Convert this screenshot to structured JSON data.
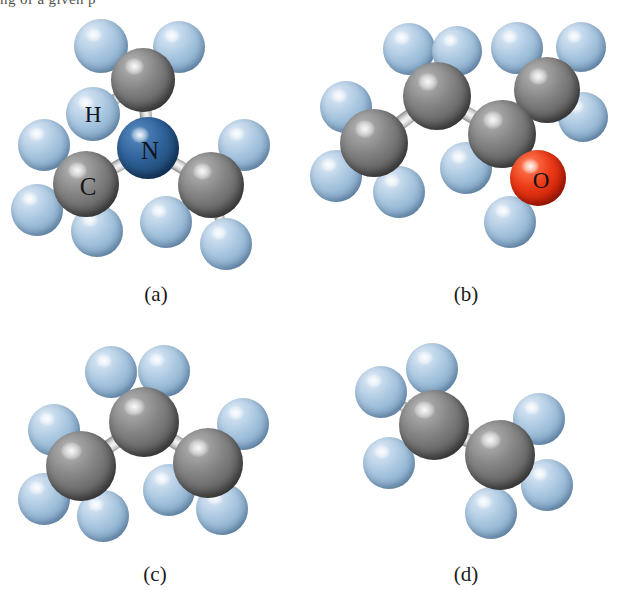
{
  "figure": {
    "clipped_header_text": "ng of a given p",
    "background_color": "#ffffff",
    "width": 623,
    "height": 590
  },
  "palette": {
    "carbon": "#787878",
    "hydrogen": "#a8c4dc",
    "nitrogen": "#2d5a8e",
    "oxygen": "#e03018",
    "bond": "#d8d8d8",
    "label_text": "#11161c",
    "caption_text": "#1a1a1a"
  },
  "panels": [
    {
      "id": "a",
      "caption": "(a)",
      "molecule_name": "trimethylamine",
      "formula": "N(CH3)3",
      "atom_counts": {
        "C": 3,
        "N": 1,
        "H": 9
      },
      "labels": [
        {
          "text": "H",
          "element": "H"
        },
        {
          "text": "N",
          "element": "N"
        },
        {
          "text": "C",
          "element": "C"
        }
      ]
    },
    {
      "id": "b",
      "caption": "(b)",
      "molecule_name": "butan-2-ol",
      "formula": "C4H9OH",
      "atom_counts": {
        "C": 4,
        "O": 1,
        "H": 10
      },
      "labels": [
        {
          "text": "O",
          "element": "O"
        }
      ]
    },
    {
      "id": "c",
      "caption": "(c)",
      "molecule_name": "propane",
      "formula": "C3H8",
      "atom_counts": {
        "C": 3,
        "H": 8
      },
      "labels": []
    },
    {
      "id": "d",
      "caption": "(d)",
      "molecule_name": "ethane",
      "formula": "C2H6",
      "atom_counts": {
        "C": 2,
        "H": 6
      },
      "labels": []
    }
  ],
  "captions": {
    "a": "(a)",
    "b": "(b)",
    "c": "(c)",
    "d": "(d)"
  },
  "atom_labels": {
    "a_H": "H",
    "a_N": "N",
    "a_C": "C",
    "b_O": "O"
  },
  "geometry": {
    "panel_a": {
      "box": [
        0,
        0,
        311,
        295
      ],
      "atoms": [
        {
          "n": "H",
          "t": "H",
          "x": 101,
          "y": 46,
          "r": 27
        },
        {
          "n": "H",
          "t": "H",
          "x": 179,
          "y": 47,
          "r": 26
        },
        {
          "n": "H",
          "t": "H",
          "x": 93,
          "y": 114,
          "r": 27
        },
        {
          "n": "C",
          "t": "C",
          "x": 143,
          "y": 80,
          "r": 32
        },
        {
          "n": "N",
          "t": "N",
          "x": 148,
          "y": 148,
          "r": 31
        },
        {
          "n": "C",
          "t": "C",
          "x": 86,
          "y": 184,
          "r": 33
        },
        {
          "n": "H",
          "t": "H",
          "x": 44,
          "y": 145,
          "r": 26
        },
        {
          "n": "H",
          "t": "H",
          "x": 37,
          "y": 210,
          "r": 26
        },
        {
          "n": "H",
          "t": "H",
          "x": 97,
          "y": 231,
          "r": 26
        },
        {
          "n": "C",
          "t": "C",
          "x": 211,
          "y": 185,
          "r": 33
        },
        {
          "n": "H",
          "t": "H",
          "x": 244,
          "y": 145,
          "r": 26
        },
        {
          "n": "H",
          "t": "H",
          "x": 166,
          "y": 222,
          "r": 26
        },
        {
          "n": "H",
          "t": "H",
          "x": 226,
          "y": 244,
          "r": 26
        }
      ],
      "bonds": [
        [
          3,
          0
        ],
        [
          3,
          1
        ],
        [
          3,
          2
        ],
        [
          3,
          4
        ],
        [
          4,
          5
        ],
        [
          4,
          9
        ],
        [
          5,
          6
        ],
        [
          5,
          7
        ],
        [
          5,
          8
        ],
        [
          9,
          10
        ],
        [
          9,
          11
        ],
        [
          9,
          12
        ]
      ],
      "labels": [
        {
          "k": "a_H",
          "x": 93,
          "y": 114,
          "size": 23
        },
        {
          "k": "a_N",
          "x": 150,
          "y": 150,
          "size": 25
        },
        {
          "k": "a_C",
          "x": 88,
          "y": 186,
          "size": 25
        }
      ],
      "caption_pos": [
        156,
        282
      ]
    },
    "panel_b": {
      "box": [
        311,
        0,
        312,
        295
      ],
      "atoms": [
        {
          "n": "H",
          "t": "H",
          "x": 98,
          "y": 49,
          "r": 26
        },
        {
          "n": "H",
          "t": "H",
          "x": 146,
          "y": 51,
          "r": 25
        },
        {
          "n": "C",
          "t": "C",
          "x": 126,
          "y": 96,
          "r": 34
        },
        {
          "n": "C",
          "t": "C",
          "x": 63,
          "y": 143,
          "r": 34
        },
        {
          "n": "H",
          "t": "H",
          "x": 35,
          "y": 107,
          "r": 26
        },
        {
          "n": "H",
          "t": "H",
          "x": 25,
          "y": 176,
          "r": 26
        },
        {
          "n": "H",
          "t": "H",
          "x": 88,
          "y": 192,
          "r": 26
        },
        {
          "n": "C",
          "t": "C",
          "x": 191,
          "y": 134,
          "r": 34
        },
        {
          "n": "H",
          "t": "H",
          "x": 155,
          "y": 168,
          "r": 26
        },
        {
          "n": "C",
          "t": "C",
          "x": 236,
          "y": 90,
          "r": 33
        },
        {
          "n": "H",
          "t": "H",
          "x": 206,
          "y": 48,
          "r": 26
        },
        {
          "n": "H",
          "t": "H",
          "x": 270,
          "y": 47,
          "r": 25
        },
        {
          "n": "H",
          "t": "H",
          "x": 272,
          "y": 117,
          "r": 25
        },
        {
          "n": "O",
          "t": "O",
          "x": 227,
          "y": 178,
          "r": 28
        },
        {
          "n": "H",
          "t": "H",
          "x": 199,
          "y": 222,
          "r": 26
        }
      ],
      "bonds": [
        [
          2,
          0
        ],
        [
          2,
          1
        ],
        [
          2,
          3
        ],
        [
          2,
          7
        ],
        [
          3,
          4
        ],
        [
          3,
          5
        ],
        [
          3,
          6
        ],
        [
          7,
          8
        ],
        [
          7,
          9
        ],
        [
          7,
          13
        ],
        [
          9,
          10
        ],
        [
          9,
          11
        ],
        [
          9,
          12
        ],
        [
          13,
          14
        ]
      ],
      "labels": [
        {
          "k": "b_O",
          "x": 230,
          "y": 180,
          "size": 23
        }
      ],
      "caption_pos": [
        155,
        282
      ]
    },
    "panel_c": {
      "box": [
        0,
        300,
        311,
        290
      ],
      "atoms": [
        {
          "n": "H",
          "t": "H",
          "x": 111,
          "y": 72,
          "r": 26
        },
        {
          "n": "H",
          "t": "H",
          "x": 164,
          "y": 71,
          "r": 26
        },
        {
          "n": "C",
          "t": "C",
          "x": 144,
          "y": 122,
          "r": 35
        },
        {
          "n": "C",
          "t": "C",
          "x": 81,
          "y": 166,
          "r": 35
        },
        {
          "n": "H",
          "t": "H",
          "x": 54,
          "y": 130,
          "r": 26
        },
        {
          "n": "H",
          "t": "H",
          "x": 44,
          "y": 199,
          "r": 26
        },
        {
          "n": "H",
          "t": "H",
          "x": 103,
          "y": 216,
          "r": 26
        },
        {
          "n": "C",
          "t": "C",
          "x": 208,
          "y": 163,
          "r": 35
        },
        {
          "n": "H",
          "t": "H",
          "x": 243,
          "y": 124,
          "r": 26
        },
        {
          "n": "H",
          "t": "H",
          "x": 169,
          "y": 190,
          "r": 26
        },
        {
          "n": "H",
          "t": "H",
          "x": 222,
          "y": 209,
          "r": 26
        }
      ],
      "bonds": [
        [
          2,
          0
        ],
        [
          2,
          1
        ],
        [
          2,
          3
        ],
        [
          2,
          7
        ],
        [
          3,
          4
        ],
        [
          3,
          5
        ],
        [
          3,
          6
        ],
        [
          7,
          8
        ],
        [
          7,
          9
        ],
        [
          7,
          10
        ]
      ],
      "caption_pos": [
        155,
        262
      ]
    },
    "panel_d": {
      "box": [
        311,
        300,
        312,
        290
      ],
      "atoms": [
        {
          "n": "H",
          "t": "H",
          "x": 121,
          "y": 69,
          "r": 26
        },
        {
          "n": "H",
          "t": "H",
          "x": 70,
          "y": 92,
          "r": 26
        },
        {
          "n": "H",
          "t": "H",
          "x": 78,
          "y": 163,
          "r": 26
        },
        {
          "n": "C",
          "t": "C",
          "x": 123,
          "y": 125,
          "r": 35
        },
        {
          "n": "C",
          "t": "C",
          "x": 189,
          "y": 155,
          "r": 35
        },
        {
          "n": "H",
          "t": "H",
          "x": 228,
          "y": 119,
          "r": 26
        },
        {
          "n": "H",
          "t": "H",
          "x": 236,
          "y": 185,
          "r": 26
        },
        {
          "n": "H",
          "t": "H",
          "x": 180,
          "y": 213,
          "r": 26
        }
      ],
      "bonds": [
        [
          3,
          0
        ],
        [
          3,
          1
        ],
        [
          3,
          2
        ],
        [
          3,
          4
        ],
        [
          4,
          5
        ],
        [
          4,
          6
        ],
        [
          4,
          7
        ]
      ],
      "caption_pos": [
        155,
        262
      ]
    }
  }
}
